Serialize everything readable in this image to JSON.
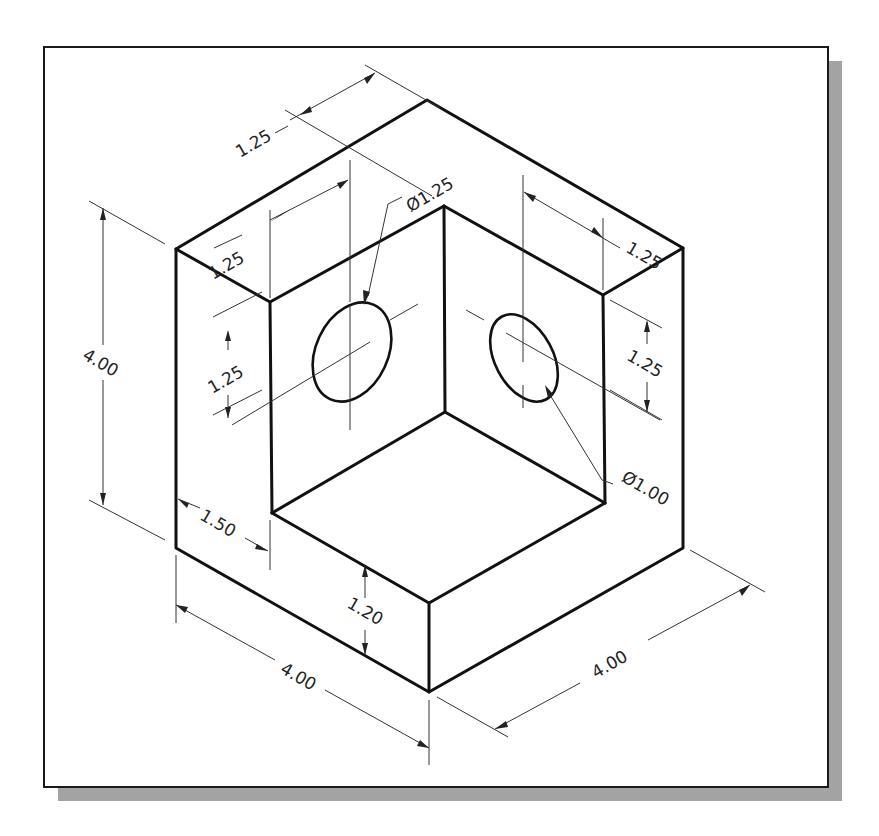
{
  "drawing": {
    "type": "isometric technical drawing",
    "part": "L-shaped corner block with two holes",
    "colors": {
      "line": "#111111",
      "shadow": "#a3a3a3",
      "background": "#ffffff"
    },
    "dimensions": {
      "overall_height": "4.00",
      "overall_width_left": "4.00",
      "overall_width_right": "4.00",
      "top_depth_back": "1.25",
      "top_depth_left_wall": "1.25",
      "top_depth_right_wall": "1.25",
      "left_hole_height": "1.25",
      "right_hole_height": "1.25",
      "left_hole_diameter": "Ø1.25",
      "right_hole_diameter": "Ø1.00",
      "step_width": "1.50",
      "base_thickness": "1.20"
    }
  }
}
